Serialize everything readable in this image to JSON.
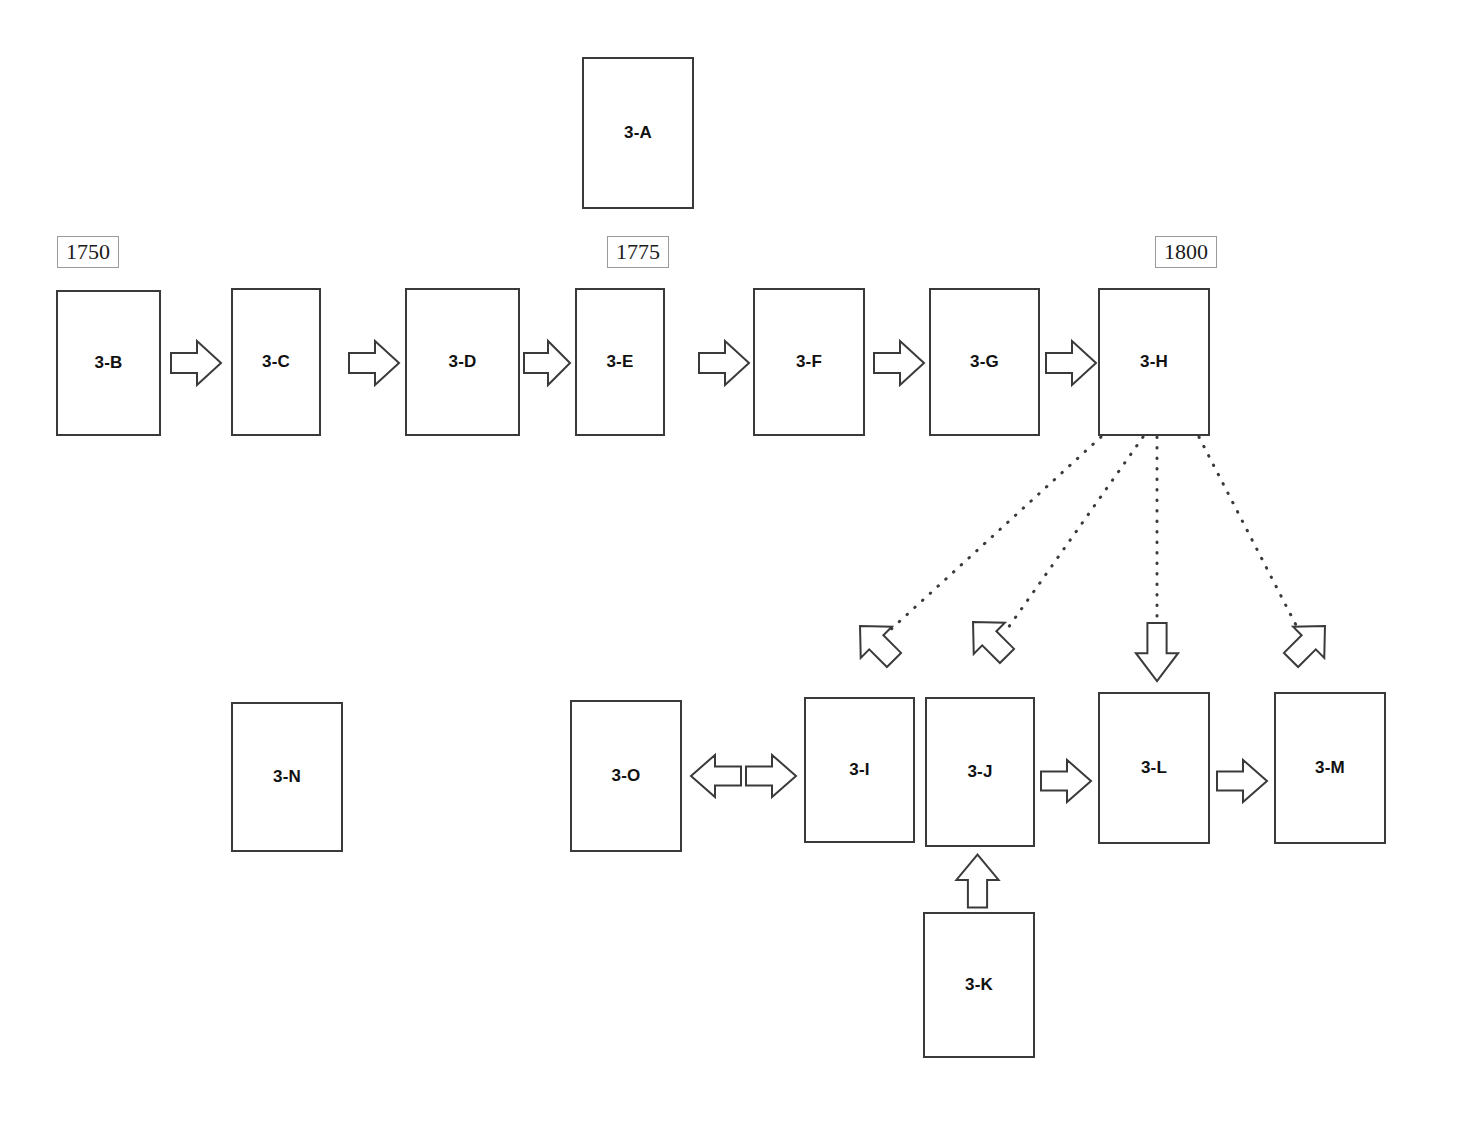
{
  "diagram": {
    "type": "flowchart",
    "background_color": "#ffffff",
    "box_border_color": "#3a3a3a",
    "box_fill_color": "#ffffff",
    "year_box_border_color": "#9a9a9a",
    "connector_color": "#3a3a3a"
  },
  "year_markers": [
    {
      "label": "1750",
      "x": 57,
      "y": 236,
      "w": 62,
      "h": 32
    },
    {
      "label": "1775",
      "x": 607,
      "y": 236,
      "w": 62,
      "h": 32
    },
    {
      "label": "1800",
      "x": 1155,
      "y": 236,
      "w": 62,
      "h": 32
    }
  ],
  "nodes": [
    {
      "id": "3-A",
      "label": "3-A",
      "x": 582,
      "y": 57,
      "w": 112,
      "h": 152
    },
    {
      "id": "3-B",
      "label": "3-B",
      "x": 56,
      "y": 290,
      "w": 105,
      "h": 146
    },
    {
      "id": "3-C",
      "label": "3-C",
      "x": 231,
      "y": 288,
      "w": 90,
      "h": 148
    },
    {
      "id": "3-D",
      "label": "3-D",
      "x": 405,
      "y": 288,
      "w": 115,
      "h": 148
    },
    {
      "id": "3-E",
      "label": "3-E",
      "x": 575,
      "y": 288,
      "w": 90,
      "h": 148
    },
    {
      "id": "3-F",
      "label": "3-F",
      "x": 753,
      "y": 288,
      "w": 112,
      "h": 148
    },
    {
      "id": "3-G",
      "label": "3-G",
      "x": 929,
      "y": 288,
      "w": 111,
      "h": 148
    },
    {
      "id": "3-H",
      "label": "3-H",
      "x": 1098,
      "y": 288,
      "w": 112,
      "h": 148
    },
    {
      "id": "3-N",
      "label": "3-N",
      "x": 231,
      "y": 702,
      "w": 112,
      "h": 150
    },
    {
      "id": "3-O",
      "label": "3-O",
      "x": 570,
      "y": 700,
      "w": 112,
      "h": 152
    },
    {
      "id": "3-I",
      "label": "3-I",
      "x": 804,
      "y": 697,
      "w": 111,
      "h": 146
    },
    {
      "id": "3-J",
      "label": "3-J",
      "x": 925,
      "y": 697,
      "w": 110,
      "h": 150
    },
    {
      "id": "3-L",
      "label": "3-L",
      "x": 1098,
      "y": 692,
      "w": 112,
      "h": 152
    },
    {
      "id": "3-M",
      "label": "3-M",
      "x": 1274,
      "y": 692,
      "w": 112,
      "h": 152
    },
    {
      "id": "3-K",
      "label": "3-K",
      "x": 923,
      "y": 912,
      "w": 112,
      "h": 146
    }
  ],
  "solid_arrows": [
    {
      "name": "arrow-b-to-c",
      "from": "3-B",
      "to": "3-C",
      "direction": "right",
      "x": 170,
      "y": 338,
      "w": 52,
      "h": 50
    },
    {
      "name": "arrow-c-to-d",
      "from": "3-C",
      "to": "3-D",
      "direction": "right",
      "x": 348,
      "y": 338,
      "w": 52,
      "h": 50
    },
    {
      "name": "arrow-d-to-e",
      "from": "3-D",
      "to": "3-E",
      "direction": "right",
      "x": 523,
      "y": 338,
      "w": 48,
      "h": 50
    },
    {
      "name": "arrow-e-to-f",
      "from": "3-E",
      "to": "3-F",
      "direction": "right",
      "x": 698,
      "y": 338,
      "w": 52,
      "h": 50
    },
    {
      "name": "arrow-f-to-g",
      "from": "3-F",
      "to": "3-G",
      "direction": "right",
      "x": 873,
      "y": 338,
      "w": 52,
      "h": 50
    },
    {
      "name": "arrow-g-to-h",
      "from": "3-G",
      "to": "3-H",
      "direction": "right",
      "x": 1045,
      "y": 338,
      "w": 52,
      "h": 50
    },
    {
      "name": "arrow-o-to-i",
      "from": "3-O",
      "to": "3-I",
      "direction": "right",
      "x": 745,
      "y": 752,
      "w": 52,
      "h": 48
    },
    {
      "name": "arrow-i-to-o",
      "from": "3-I",
      "to": "3-O",
      "direction": "left",
      "x": 690,
      "y": 752,
      "w": 52,
      "h": 48
    },
    {
      "name": "arrow-j-to-l",
      "from": "3-J",
      "to": "3-L",
      "direction": "right",
      "x": 1040,
      "y": 757,
      "w": 52,
      "h": 48
    },
    {
      "name": "arrow-l-to-m",
      "from": "3-L",
      "to": "3-M",
      "direction": "right",
      "x": 1216,
      "y": 757,
      "w": 52,
      "h": 48
    },
    {
      "name": "arrow-k-to-j",
      "from": "3-K",
      "to": "3-J",
      "direction": "up",
      "x": 953,
      "y": 853,
      "w": 48,
      "h": 55
    }
  ],
  "dotted_connectors": [
    {
      "name": "dotted-h-to-i",
      "from": "3-H",
      "to": "3-I",
      "x1": 1101,
      "y1": 437,
      "x2": 888,
      "y2": 632
    },
    {
      "name": "dotted-h-to-j",
      "from": "3-H",
      "to": "3-J",
      "x1": 1143,
      "y1": 437,
      "x2": 1008,
      "y2": 628
    },
    {
      "name": "dotted-h-to-l",
      "from": "3-H",
      "to": "3-L",
      "x1": 1157,
      "y1": 437,
      "x2": 1157,
      "y2": 638
    },
    {
      "name": "dotted-h-to-m",
      "from": "3-H",
      "to": "3-M",
      "x1": 1199,
      "y1": 437,
      "x2": 1296,
      "y2": 625
    }
  ],
  "dotted_arrowheads": [
    {
      "name": "dotted-arrowhead-to-i",
      "x": 852,
      "y": 618,
      "w": 50,
      "h": 50,
      "rotation": 225
    },
    {
      "name": "dotted-arrowhead-to-j",
      "x": 965,
      "y": 614,
      "w": 50,
      "h": 50,
      "rotation": 225
    },
    {
      "name": "dotted-arrowhead-to-l",
      "x": 1133,
      "y": 622,
      "w": 48,
      "h": 60,
      "rotation": 0
    },
    {
      "name": "dotted-arrowhead-to-m",
      "x": 1283,
      "y": 618,
      "w": 50,
      "h": 50,
      "rotation": 315
    }
  ]
}
